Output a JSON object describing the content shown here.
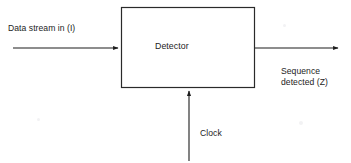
{
  "figure": {
    "type": "block-diagram",
    "background_color": "#ffffff",
    "line_color": "#1d1d1d"
  },
  "block": {
    "label": "Detector",
    "x": 121,
    "y": 7,
    "width": 134,
    "height": 81
  },
  "signals": {
    "input": {
      "label": "Data stream in (I)",
      "direction": "left-to-right",
      "from_x": 13,
      "to_x": 121,
      "y": 48
    },
    "output": {
      "label_line1": "Sequence",
      "label_line2": "detected (Z)",
      "direction": "left-to-right",
      "from_x": 255,
      "to_x": 341,
      "y": 48
    },
    "clock": {
      "label": "Clock",
      "direction": "bottom-to-top",
      "x": 189,
      "from_y": 161,
      "to_y": 88
    }
  }
}
